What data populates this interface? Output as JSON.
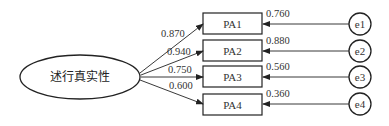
{
  "diagram": {
    "type": "structural-equation-model",
    "latent": {
      "label": "述行真实性"
    },
    "indicators": [
      {
        "label": "PA1",
        "loading": "0.870",
        "r2": "0.760",
        "error": "e1"
      },
      {
        "label": "PA2",
        "loading": "0.940",
        "r2": "0.880",
        "error": "e2"
      },
      {
        "label": "PA3",
        "loading": "0.750",
        "r2": "0.560",
        "error": "e3"
      },
      {
        "label": "PA4",
        "loading": "0.600",
        "r2": "0.360",
        "error": "e4"
      }
    ]
  }
}
